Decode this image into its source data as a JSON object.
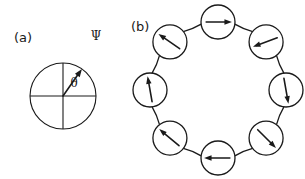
{
  "figure": {
    "width": 305,
    "height": 179,
    "background_color": "#ffffff",
    "ink_color": "#1a1a1a"
  },
  "panels": [
    {
      "id": "a",
      "label": "(a)",
      "label_x": 14,
      "label_y": 42,
      "description": "single spin vector in a circle with cartesian axes",
      "circle": {
        "cx": 63,
        "cy": 96,
        "r": 33
      },
      "axes": {
        "horizontal": {
          "x1": 30,
          "y1": 96,
          "x2": 96,
          "y2": 96
        },
        "vertical": {
          "x1": 63,
          "y1": 63,
          "x2": 63,
          "y2": 129
        }
      },
      "vector": {
        "symbol": "Ψ",
        "symbol_x": 96,
        "symbol_y": 40,
        "angle_deg": 55,
        "length": 33,
        "origin_x": 63,
        "origin_y": 96
      },
      "angle_mark": {
        "symbol": "θ",
        "symbol_x": 74,
        "symbol_y": 87,
        "arc_radius": 16,
        "from_deg": 0,
        "to_deg": 55
      }
    },
    {
      "id": "b",
      "label": "(b)",
      "label_x": 131,
      "label_y": 31,
      "description": "ring of eight coupled spins",
      "ring": {
        "cx": 218,
        "cy": 90,
        "radius": 68
      },
      "node_radius": 17,
      "nodes": [
        {
          "index": 0,
          "name": "node-top",
          "ring_angle_deg": 90,
          "arrow_angle_deg": 0,
          "arrow_direction": "east"
        },
        {
          "index": 1,
          "name": "node-top-right",
          "ring_angle_deg": 45,
          "arrow_angle_deg": 200,
          "arrow_direction": "west-southwest"
        },
        {
          "index": 2,
          "name": "node-right",
          "ring_angle_deg": 0,
          "arrow_angle_deg": 280,
          "arrow_direction": "south"
        },
        {
          "index": 3,
          "name": "node-bottom-right",
          "ring_angle_deg": 315,
          "arrow_angle_deg": 315,
          "arrow_direction": "southeast"
        },
        {
          "index": 4,
          "name": "node-bottom",
          "ring_angle_deg": 270,
          "arrow_angle_deg": 180,
          "arrow_direction": "west"
        },
        {
          "index": 5,
          "name": "node-bottom-left",
          "ring_angle_deg": 225,
          "arrow_angle_deg": 140,
          "arrow_direction": "northwest"
        },
        {
          "index": 6,
          "name": "node-left",
          "ring_angle_deg": 180,
          "arrow_angle_deg": 100,
          "arrow_direction": "north"
        },
        {
          "index": 7,
          "name": "node-top-left",
          "ring_angle_deg": 135,
          "arrow_angle_deg": 145,
          "arrow_direction": "northwest"
        }
      ]
    }
  ]
}
